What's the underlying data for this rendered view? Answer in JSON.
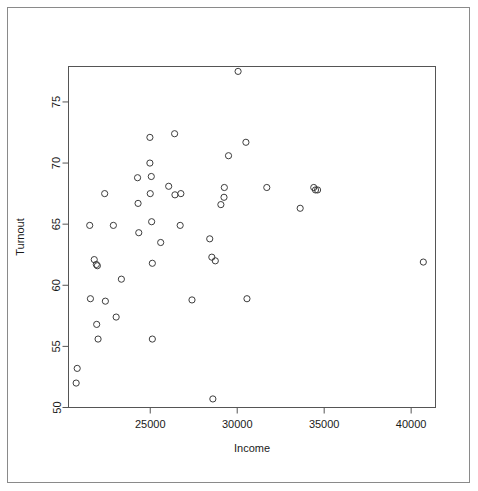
{
  "chart_data": {
    "type": "scatter",
    "title": "",
    "xlabel": "Income",
    "ylabel": "Turnout",
    "xlim": [
      20300,
      41400
    ],
    "ylim": [
      50.0,
      77.9
    ],
    "xticks": [
      25000,
      30000,
      35000,
      40000
    ],
    "yticks": [
      50,
      55,
      60,
      65,
      70,
      75
    ],
    "xtick_labels": [
      "25000",
      "30000",
      "35000",
      "40000"
    ],
    "ytick_labels": [
      "50",
      "55",
      "60",
      "65",
      "70",
      "75"
    ],
    "grid": false,
    "legend": null,
    "marker": "open-circle",
    "marker_color": "#3d3d3d",
    "n_points": 50,
    "points": [
      {
        "x": 20800,
        "y": 53.2
      },
      {
        "x": 20740,
        "y": 52.0
      },
      {
        "x": 21520,
        "y": 64.9
      },
      {
        "x": 21560,
        "y": 58.9
      },
      {
        "x": 21780,
        "y": 62.1
      },
      {
        "x": 21900,
        "y": 61.7
      },
      {
        "x": 21960,
        "y": 61.6
      },
      {
        "x": 21920,
        "y": 56.8
      },
      {
        "x": 22000,
        "y": 55.6
      },
      {
        "x": 22380,
        "y": 67.5
      },
      {
        "x": 22420,
        "y": 58.7
      },
      {
        "x": 22880,
        "y": 64.9
      },
      {
        "x": 23040,
        "y": 57.4
      },
      {
        "x": 23340,
        "y": 60.5
      },
      {
        "x": 24270,
        "y": 68.8
      },
      {
        "x": 24300,
        "y": 66.7
      },
      {
        "x": 24340,
        "y": 64.3
      },
      {
        "x": 24980,
        "y": 72.1
      },
      {
        "x": 24980,
        "y": 70.0
      },
      {
        "x": 25060,
        "y": 68.9
      },
      {
        "x": 25000,
        "y": 67.5
      },
      {
        "x": 25080,
        "y": 65.2
      },
      {
        "x": 25120,
        "y": 61.8
      },
      {
        "x": 25120,
        "y": 55.6
      },
      {
        "x": 25600,
        "y": 63.5
      },
      {
        "x": 26060,
        "y": 68.1
      },
      {
        "x": 26400,
        "y": 72.4
      },
      {
        "x": 26420,
        "y": 67.4
      },
      {
        "x": 26760,
        "y": 67.5
      },
      {
        "x": 26720,
        "y": 64.9
      },
      {
        "x": 27400,
        "y": 58.8
      },
      {
        "x": 28420,
        "y": 63.8
      },
      {
        "x": 28540,
        "y": 62.3
      },
      {
        "x": 28740,
        "y": 62.0
      },
      {
        "x": 28600,
        "y": 50.7
      },
      {
        "x": 29060,
        "y": 66.6
      },
      {
        "x": 29260,
        "y": 68.0
      },
      {
        "x": 29240,
        "y": 67.2
      },
      {
        "x": 29500,
        "y": 70.6
      },
      {
        "x": 30050,
        "y": 77.5
      },
      {
        "x": 30500,
        "y": 71.7
      },
      {
        "x": 30560,
        "y": 58.9
      },
      {
        "x": 31700,
        "y": 68.0
      },
      {
        "x": 33620,
        "y": 66.3
      },
      {
        "x": 34400,
        "y": 68.0
      },
      {
        "x": 34500,
        "y": 67.8
      },
      {
        "x": 34620,
        "y": 67.8
      },
      {
        "x": 40700,
        "y": 61.9
      }
    ]
  },
  "axes": {
    "x_title": "Income",
    "y_title": "Turnout"
  }
}
